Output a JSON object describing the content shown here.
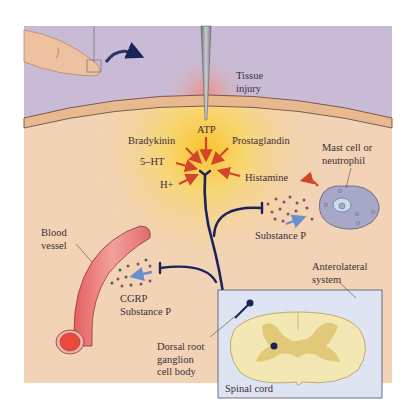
{
  "figure": {
    "type": "pain pathway schematic",
    "labels": {
      "tissue_injury": "Tissue\ninjury",
      "atp": "ATP",
      "bradykinin": "Bradykinin",
      "prostaglandin": "Prostaglandin",
      "serotonin": "5–HT",
      "hydrogen_ion": "H+",
      "histamine": "Histamine",
      "mast_cell": "Mast cell or\nneutrophil",
      "substance_p": "Substance P",
      "blood_vessel": "Blood\nvessel",
      "cgrp_substance_p": "CGRP\nSubstance P",
      "dorsal_root_ganglion": "Dorsal root\nganglion\ncell body",
      "anterolateral_system": "Anterolateral\nsystem",
      "spinal_cord": "Spinal cord"
    },
    "colors": {
      "skin_surface": "#c9bbd6",
      "epidermis": "#e8b98f",
      "tissue": "#f2d3b5",
      "inflammation_glow": "#f7c83a",
      "nerve": "#1c2358",
      "chemical_arrow": "#d3452a",
      "release_arrow": "#6b8fc9",
      "blood_vessel": "#e9797a",
      "mast_cell": "#a7a8c8",
      "spinal_box": "#dfe4f2",
      "grey_matter": "#e2c979",
      "white_matter": "#f3e7b4"
    }
  }
}
